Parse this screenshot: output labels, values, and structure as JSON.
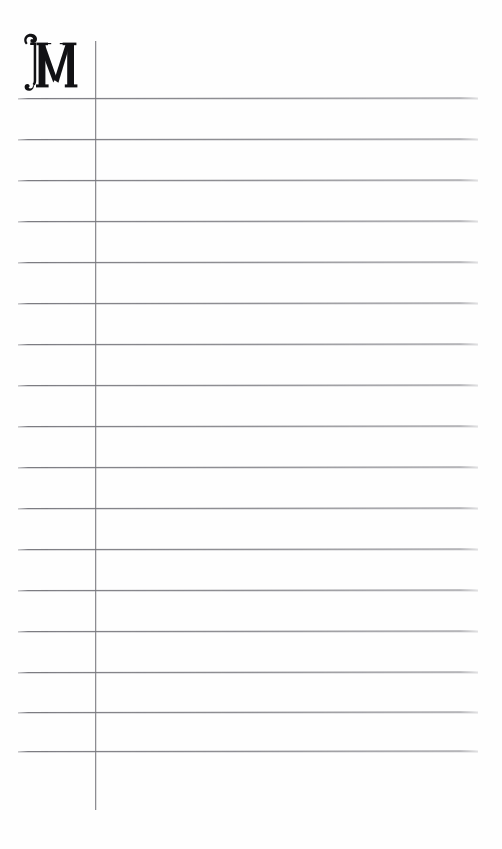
{
  "page": {
    "type": "ruled-notebook-page",
    "background_color": "#fefefe",
    "width": 502,
    "height": 849
  },
  "dropcap": {
    "letter": "M",
    "style": "decorative-blackletter-capital",
    "color": "#111114",
    "left": 18,
    "top": 30,
    "width": 62,
    "height": 70
  },
  "margin_rule": {
    "name": "vertical-margin-line",
    "color": "#8d8d92",
    "x": 95,
    "top": 41,
    "bottom": 810
  },
  "rules": {
    "color": "#707076",
    "left": 18,
    "right": 478,
    "spacing": 41,
    "count": 17,
    "lines": [
      {
        "y": 98,
        "slant": -1.5
      },
      {
        "y": 139,
        "slant": -1.5
      },
      {
        "y": 180,
        "slant": -1.5
      },
      {
        "y": 221,
        "slant": -1.5
      },
      {
        "y": 262,
        "slant": -1.5
      },
      {
        "y": 303,
        "slant": -1.5
      },
      {
        "y": 344,
        "slant": -1.5
      },
      {
        "y": 385,
        "slant": -1.5
      },
      {
        "y": 426,
        "slant": -1.5
      },
      {
        "y": 467,
        "slant": -1.5
      },
      {
        "y": 508,
        "slant": -1.5
      },
      {
        "y": 549,
        "slant": -1.5
      },
      {
        "y": 590,
        "slant": -1.5
      },
      {
        "y": 631,
        "slant": -1.5
      },
      {
        "y": 672,
        "slant": -1.5
      },
      {
        "y": 712,
        "slant": -1.5
      },
      {
        "y": 751,
        "slant": -1.5
      }
    ]
  }
}
